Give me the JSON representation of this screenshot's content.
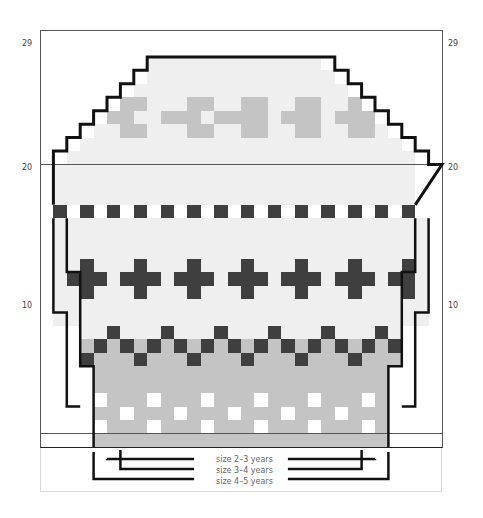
{
  "chart_title": "Knitting colourwork chart",
  "grid": {
    "cols": 30,
    "rows": 31,
    "left": 40,
    "top": 30,
    "cell_w": 13.4,
    "cell_h": 13.45
  },
  "colors": {
    "dark": "#3f3f3f",
    "mid": "#c4c4c4",
    "light": "#efefef",
    "white": "#ffffff",
    "outline": "#111111"
  },
  "row_labels": [
    {
      "text": "29",
      "row": 29
    },
    {
      "text": "20",
      "row": 20
    },
    {
      "text": "10",
      "row": 10
    }
  ],
  "legend": {
    "items": [
      {
        "label": "size 2–3 years"
      },
      {
        "label": "size 3–4 years"
      },
      {
        "label": "size 4–5 years"
      }
    ]
  },
  "chart_data": {
    "type": "heatmap",
    "xlabel": "stitches (30)",
    "ylabel": "rows (31)",
    "row_ticks": [
      10,
      20,
      29
    ],
    "legend_entries": [
      "size 2–3 years",
      "size 3–4 years",
      "size 4–5 years"
    ]
  }
}
